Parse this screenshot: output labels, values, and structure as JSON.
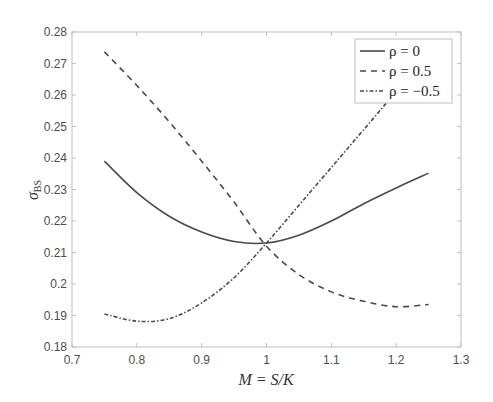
{
  "chart_data": {
    "type": "line",
    "title": "",
    "xlabel": "M = S/K",
    "ylabel_main": "σ",
    "ylabel_sub": "BS",
    "xlim": [
      0.7,
      1.3
    ],
    "ylim": [
      0.18,
      0.28
    ],
    "xticks": [
      0.7,
      0.8,
      0.9,
      1.0,
      1.1,
      1.2,
      1.3
    ],
    "xtick_labels": [
      "0.7",
      "0.8",
      "0.9",
      "1",
      "1.1",
      "1.2",
      "1.3"
    ],
    "yticks": [
      0.18,
      0.19,
      0.2,
      0.21,
      0.22,
      0.23,
      0.24,
      0.25,
      0.26,
      0.27,
      0.28
    ],
    "ytick_labels": [
      "0.18",
      "0.19",
      "0.2",
      "0.21",
      "0.22",
      "0.23",
      "0.24",
      "0.25",
      "0.26",
      "0.27",
      "0.28"
    ],
    "grid": false,
    "legend_position": "top-right",
    "x": [
      0.75,
      0.8,
      0.85,
      0.9,
      0.95,
      1.0,
      1.05,
      1.1,
      1.15,
      1.2,
      1.25
    ],
    "series": [
      {
        "name": "ρ = 0",
        "style": "solid",
        "color": "#4a4a4a",
        "values": [
          0.239,
          0.229,
          0.2215,
          0.2165,
          0.2135,
          0.213,
          0.2155,
          0.22,
          0.2255,
          0.2305,
          0.2352
        ]
      },
      {
        "name": "ρ = 0.5",
        "style": "dashed",
        "color": "#4a4a4a",
        "values": [
          0.2737,
          0.263,
          0.2515,
          0.239,
          0.226,
          0.212,
          0.203,
          0.1975,
          0.1945,
          0.1928,
          0.1935
        ]
      },
      {
        "name": "ρ = −0.5",
        "style": "dashdot",
        "color": "#4a4a4a",
        "values": [
          0.1905,
          0.1882,
          0.189,
          0.194,
          0.202,
          0.213,
          0.225,
          0.237,
          0.249,
          0.261,
          0.272
        ]
      }
    ]
  }
}
